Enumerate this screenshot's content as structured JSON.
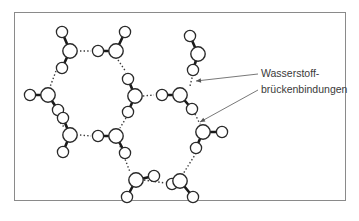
{
  "figure": {
    "type": "water-molecule-hydrogen-bond-network",
    "label": {
      "line1": "Wasserstoff-",
      "line2": "brückenbindungen"
    },
    "colors": {
      "outline": "#2a2a2a",
      "bond": "#1a1a1a",
      "frame": "#8a8a8a",
      "text": "#3a3a3a"
    },
    "molecules": [
      {
        "id": "m1",
        "o": [
          70,
          51
        ],
        "h": [
          [
            62,
            32
          ],
          [
            62,
            68
          ]
        ]
      },
      {
        "id": "m2",
        "o": [
          116,
          51
        ],
        "h": [
          [
            98,
            51
          ],
          [
            125,
            32
          ]
        ]
      },
      {
        "id": "m3",
        "o": [
          48,
          95
        ],
        "h": [
          [
            30,
            95
          ],
          [
            58,
            110
          ]
        ]
      },
      {
        "id": "m4",
        "o": [
          135,
          96
        ],
        "h": [
          [
            128,
            79
          ],
          [
            128,
            112
          ]
        ]
      },
      {
        "id": "m5",
        "o": [
          70,
          135
        ],
        "h": [
          [
            63,
            152
          ],
          [
            63,
            118
          ]
        ]
      },
      {
        "id": "m6",
        "o": [
          116,
          136
        ],
        "h": [
          [
            98,
            136
          ],
          [
            125,
            153
          ]
        ]
      },
      {
        "id": "m7",
        "o": [
          136,
          180
        ],
        "h": [
          [
            127,
            197
          ],
          [
            154,
            176
          ]
        ]
      },
      {
        "id": "m8",
        "o": [
          180,
          181
        ],
        "h": [
          [
            172,
            184
          ],
          [
            193,
            197
          ]
        ]
      },
      {
        "id": "m9",
        "o": [
          198,
          54
        ],
        "h": [
          [
            190,
            36
          ],
          [
            193,
            70
          ]
        ]
      },
      {
        "id": "m10",
        "o": [
          180,
          95
        ],
        "h": [
          [
            162,
            95
          ],
          [
            192,
            109
          ]
        ]
      },
      {
        "id": "m11",
        "o": [
          203,
          132
        ],
        "h": [
          [
            222,
            132
          ],
          [
            196,
            148
          ]
        ]
      },
      {
        "id": "m12",
        "o": [
          80,
          135
        ],
        "h": []
      }
    ],
    "hydrogen_bonds": [
      [
        [
          80,
          51
        ],
        [
          91,
          51
        ]
      ],
      [
        [
          56,
          71
        ],
        [
          50,
          87
        ]
      ],
      [
        [
          118,
          60
        ],
        [
          126,
          72
        ]
      ],
      [
        [
          126,
          118
        ],
        [
          120,
          128
        ]
      ],
      [
        [
          80,
          135
        ],
        [
          91,
          136
        ]
      ],
      [
        [
          58,
          120
        ],
        [
          64,
          127
        ]
      ],
      [
        [
          120,
          146
        ],
        [
          130,
          172
        ]
      ],
      [
        [
          144,
          180
        ],
        [
          165,
          183
        ]
      ],
      [
        [
          143,
          96
        ],
        [
          154,
          95
        ]
      ],
      [
        [
          193,
          74
        ],
        [
          190,
          86
        ]
      ],
      [
        [
          195,
          114
        ],
        [
          200,
          124
        ]
      ],
      [
        [
          198,
          150
        ],
        [
          183,
          174
        ]
      ]
    ],
    "pointers": [
      {
        "from": [
          258,
          74
        ],
        "to": [
          196,
          81
        ]
      },
      {
        "from": [
          258,
          90
        ],
        "to": [
          200,
          122
        ]
      }
    ]
  }
}
